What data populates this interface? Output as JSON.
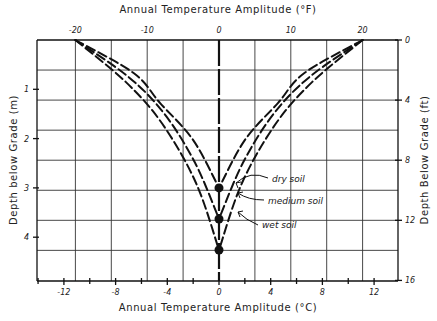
{
  "chart_data": {
    "type": "line",
    "title": "",
    "x_top": {
      "label": "Annual Temperature Amplitude (°F)",
      "ticks": [
        -20,
        -10,
        0,
        10,
        20
      ],
      "range": [
        -25.3,
        24.9
      ]
    },
    "x_bottom": {
      "label": "Annual Temperature Amplitude (°C)",
      "ticks": [
        -12,
        -8,
        -4,
        0,
        4,
        8,
        12
      ],
      "minor_ticks": [
        -14,
        -10,
        -6,
        -2,
        2,
        6,
        10,
        14
      ]
    },
    "y_left": {
      "label": "Depth below Grade (m)",
      "ticks": [
        1,
        2,
        3,
        4
      ],
      "range": [
        0,
        4.88
      ]
    },
    "y_right": {
      "label": "Depth Below Grade (ft)",
      "ticks": [
        0,
        4,
        8,
        12,
        16
      ],
      "range": [
        0,
        16
      ]
    },
    "grid": true,
    "grid_x_step_F": 5,
    "grid_y_step_ft": 2,
    "series": [
      {
        "name": "dry soil",
        "converge_depth_m": 3.0,
        "points_m_F": [
          [
            0,
            20
          ],
          [
            0.67,
            11.9
          ],
          [
            1.28,
            8.2
          ],
          [
            2.03,
            3.6
          ],
          [
            3.0,
            0
          ]
        ]
      },
      {
        "name": "medium soil",
        "converge_depth_m": 3.63,
        "points_m_F": [
          [
            0,
            20
          ],
          [
            0.75,
            12.6
          ],
          [
            1.5,
            7.6
          ],
          [
            2.5,
            3.3
          ],
          [
            3.63,
            0
          ]
        ]
      },
      {
        "name": "wet soil",
        "converge_depth_m": 4.26,
        "points_m_F": [
          [
            0,
            20
          ],
          [
            0.85,
            13.0
          ],
          [
            1.7,
            7.9
          ],
          [
            2.9,
            3.2
          ],
          [
            4.26,
            0
          ]
        ]
      }
    ],
    "annotations": [
      {
        "text": "dry soil",
        "series": "dry soil"
      },
      {
        "text": "medium soil",
        "series": "medium soil"
      },
      {
        "text": "wet soil",
        "series": "wet soil"
      }
    ],
    "markers": [
      {
        "depth_m": 3.0,
        "value_F": 0
      },
      {
        "depth_m": 3.63,
        "value_F": 0
      },
      {
        "depth_m": 4.26,
        "value_F": 0
      }
    ]
  }
}
